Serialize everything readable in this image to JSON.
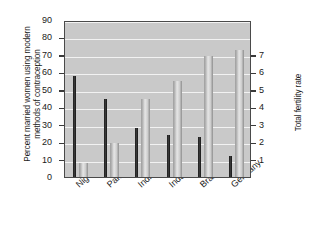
{
  "chart_data": {
    "type": "bar",
    "title": "",
    "categories": [
      "Nigeria",
      "Pakistan",
      "India",
      "Indonesia",
      "Brazil",
      "Germany"
    ],
    "series": [
      {
        "name": "Percent married women using modern methods of contraception",
        "axis": "left",
        "values": [
          8,
          19.5,
          45,
          55,
          69.5,
          73
        ],
        "color": "#c0c0c0"
      },
      {
        "name": "Total fertility rate",
        "axis": "right",
        "values": [
          5.8,
          4.5,
          2.8,
          2.4,
          2.3,
          1.2
        ],
        "color": "#1c1c1c"
      }
    ],
    "ylabel": "Percent married women using modern methods of contraception",
    "ylabel_right": "Total fertility rate",
    "xlabel": "",
    "ylim": [
      0,
      90
    ],
    "ylim_right": [
      0,
      9
    ],
    "yticks": [
      0,
      10,
      20,
      30,
      40,
      50,
      60,
      70,
      80,
      90
    ],
    "yticks_right": [
      1,
      2,
      3,
      4,
      5,
      6,
      7
    ],
    "grid": true,
    "legend": "none",
    "plot_background": "#c9c9c9",
    "gridline_color": "#f2f2f2"
  },
  "axes": {
    "left": {
      "title": "Percent married women using modern methods of contraception",
      "ticks": [
        "0",
        "10",
        "20",
        "30",
        "40",
        "50",
        "60",
        "70",
        "80",
        "90"
      ]
    },
    "right": {
      "title": "Total fertility rate",
      "ticks": [
        "1",
        "2",
        "3",
        "4",
        "5",
        "6",
        "7"
      ]
    },
    "x": {
      "labels": [
        "Nigeria",
        "Pakistan",
        "India",
        "Indonesia",
        "Brazil",
        "Germany"
      ]
    }
  }
}
